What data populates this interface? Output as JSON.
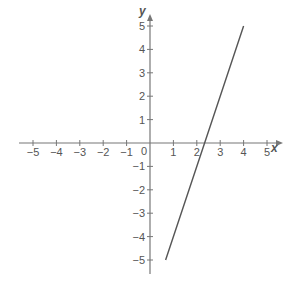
{
  "chart_data": {
    "type": "line",
    "title": "",
    "xlabel": "x",
    "ylabel": "y",
    "xlim": [
      -5,
      5
    ],
    "ylim": [
      -5,
      5
    ],
    "grid": false,
    "legend": null,
    "x_ticks": [
      -5,
      -4,
      -3,
      -2,
      -1,
      1,
      2,
      3,
      4,
      5
    ],
    "y_ticks": [
      -5,
      -4,
      -3,
      -2,
      -1,
      1,
      2,
      3,
      4,
      5
    ],
    "origin_label": "0",
    "series": [
      {
        "name": "y = 3x - 7",
        "equation": "y = 3x - 7",
        "x": [
          0.6667,
          4
        ],
        "y": [
          -5,
          5
        ],
        "color": "#555555"
      }
    ]
  },
  "colors": {
    "axis": "#777777",
    "text": "#555555",
    "line": "#555555"
  },
  "layout": {
    "origin_px": [
      150,
      143
    ],
    "unit_px": 23.4
  }
}
